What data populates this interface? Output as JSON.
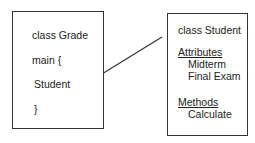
{
  "diagram": {
    "grade_box": {
      "lines": [
        "class Grade",
        "main {",
        "Student",
        "}"
      ]
    },
    "student_box": {
      "title": "class Student",
      "attributes_heading": "Attributes",
      "attributes": [
        "Midterm",
        "Final Exam"
      ],
      "methods_heading": "Methods",
      "methods": [
        "Calculate"
      ]
    },
    "connector": {
      "from": "Student",
      "to": "class Student",
      "color": "#333333"
    }
  }
}
